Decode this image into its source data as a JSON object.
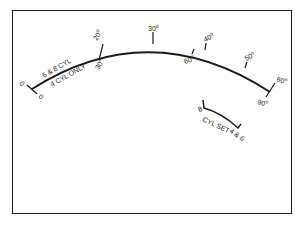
{
  "diagram": {
    "type": "dial-scale",
    "outer_scale": {
      "labels": [
        "0",
        "20",
        "30",
        "40",
        "50",
        "60"
      ],
      "degree_symbol": "o"
    },
    "inner_scale": {
      "labels": [
        "0",
        "30",
        "60",
        "90"
      ],
      "degree_symbol": "o"
    },
    "arc_labels": {
      "upper": "6 & 8 CYL",
      "lower": "4 CYL ONLY"
    },
    "cyl_set": {
      "label": "CYL SET",
      "left_end": "8",
      "right_end": "4 & 6"
    },
    "colors": {
      "ink": "#1a1a1a",
      "background": "#ffffff"
    }
  }
}
